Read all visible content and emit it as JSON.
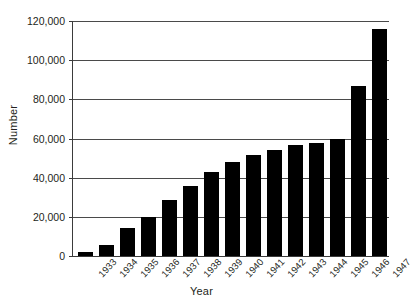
{
  "chart_data": {
    "type": "bar",
    "title": "",
    "subtitle": "",
    "xlabel": "Year",
    "ylabel": "Number",
    "categories": [
      "1933",
      "1934",
      "1935",
      "1936",
      "1937",
      "1938",
      "1939",
      "1940",
      "1941",
      "1942",
      "1943",
      "1944",
      "1945",
      "1946",
      "1947"
    ],
    "values": [
      2000,
      5500,
      14500,
      20000,
      28500,
      36000,
      43000,
      48000,
      51500,
      54000,
      56500,
      57500,
      59500,
      87000,
      116000
    ],
    "series": [
      {
        "name": "Number",
        "values": [
          2000,
          5500,
          14500,
          20000,
          28500,
          36000,
          43000,
          48000,
          51500,
          54000,
          56500,
          57500,
          59500,
          87000,
          116000
        ]
      }
    ],
    "ylim": [
      0,
      120000
    ],
    "yticks": [
      0,
      20000,
      40000,
      60000,
      80000,
      100000,
      120000
    ],
    "ytick_labels": [
      "0",
      "20,000",
      "40,000",
      "60,000",
      "80,000",
      "100,000",
      "120,000"
    ],
    "grid": true,
    "grid_axis": "y",
    "legend": false,
    "legend_position": "none",
    "bar_color": "#000000",
    "axis_color": "#3b3b3b",
    "gridline_color": "#4a4a4a",
    "background_color": "#ffffff",
    "xtick_rotation": -47,
    "annotations": []
  }
}
